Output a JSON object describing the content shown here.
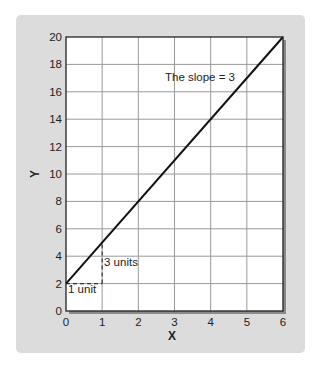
{
  "chart_data": {
    "type": "line",
    "title": "",
    "xlabel": "X",
    "ylabel": "Y",
    "xlim": [
      0,
      6
    ],
    "ylim": [
      0,
      20
    ],
    "grid": true,
    "x_ticks": [
      0,
      1,
      2,
      3,
      4,
      5,
      6
    ],
    "y_ticks": [
      0,
      2,
      4,
      6,
      8,
      10,
      12,
      14,
      16,
      18,
      20
    ],
    "series": [
      {
        "name": "y = 3x + 2",
        "x": [
          0,
          6
        ],
        "y": [
          2,
          20
        ]
      }
    ],
    "annotations": [
      {
        "text": "The slope = 3",
        "x": 3.1,
        "y": 17
      },
      {
        "text": "3 units",
        "x": 1.05,
        "y": 3.5
      },
      {
        "text": "1 unit",
        "x": 0.05,
        "y": 1.3
      }
    ],
    "slope_triangle": {
      "run": {
        "from": [
          0,
          2
        ],
        "to": [
          1,
          2
        ],
        "label": "1 unit"
      },
      "rise": {
        "from": [
          1,
          2
        ],
        "to": [
          1,
          5
        ],
        "label": "3 units"
      }
    }
  },
  "labels": {
    "x_axis": "X",
    "y_axis": "Y",
    "slope": "The slope = 3",
    "rise": "3 units",
    "run": "1 unit"
  }
}
